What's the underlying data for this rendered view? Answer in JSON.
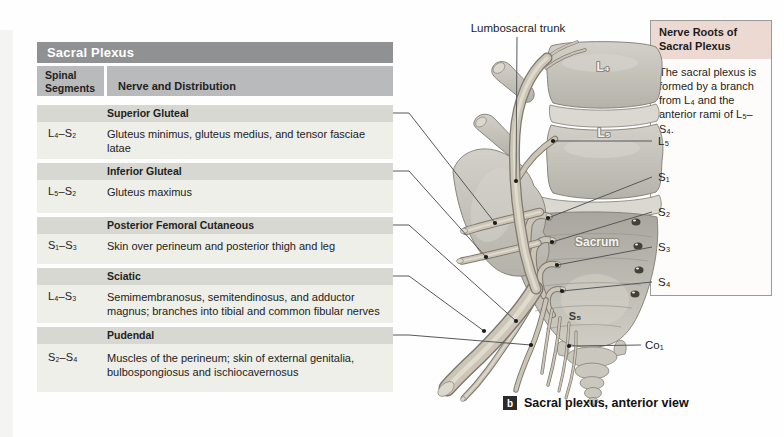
{
  "table": {
    "title": "Sacral Plexus",
    "columns": {
      "col1": "Spinal Segments",
      "col2": "Nerve and Distribution"
    },
    "sections": [
      {
        "title": "Superior Gluteal",
        "segments": "L₄–S₂",
        "description": "Gluteus minimus, gluteus medius, and tensor fasciae latae"
      },
      {
        "title": "Inferior Gluteal",
        "segments": "L₅–S₂",
        "description": "Gluteus maximus"
      },
      {
        "title": "Posterior Femoral Cutaneous",
        "segments": "S₁–S₃",
        "description": "Skin over perineum and posterior thigh and leg"
      },
      {
        "title": "Sciatic",
        "segments": "L₄–S₃",
        "description": "Semimembranosus, semitendinosus, and adductor magnus; branches into tibial and common fibular nerves"
      },
      {
        "title": "Pudendal",
        "segments": "S₂–S₄",
        "description": "Muscles of the perineum; skin of external genitalia, bulbospongiosus and ischiocavernosus"
      }
    ]
  },
  "info_box": {
    "title": "Nerve Roots of Sacral Plexus",
    "body": "The sacral plexus is formed by a branch from L₄ and the anterior rami of L₅–S₄."
  },
  "illustration": {
    "labels": {
      "lumbosacral_trunk": "Lumbosacral trunk",
      "l4": "L₄",
      "l5": "L₅",
      "sacrum": "Sacrum",
      "s5": "S₅",
      "root_l5": "L₅",
      "root_s1": "S₁",
      "root_s2": "S₂",
      "root_s3": "S₃",
      "root_s4": "S₄",
      "co1": "Co₁"
    }
  },
  "caption": {
    "marker": "b",
    "text": "Sacral plexus, anterior view"
  },
  "colors": {
    "table_title_bg": "#8f9193",
    "column_header_bg": "#b9babc",
    "section_bar_bg": "#d6d8d1",
    "row_bg": "#eeefe9",
    "info_header_bg": "#ecd9d2",
    "bone": "#c6c3bb",
    "nerve": "#ccc5b6",
    "leader_line": "#55585a"
  }
}
